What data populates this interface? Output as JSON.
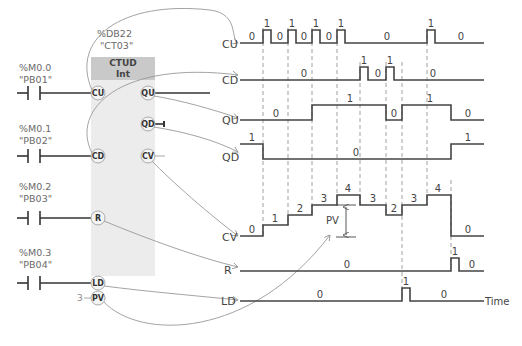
{
  "block": {
    "db_address": "%DB22",
    "db_name": "\"CT03\"",
    "type": "CTUD",
    "datatype": "Int",
    "inputs": [
      "CU",
      "CD",
      "R",
      "LD",
      "PV"
    ],
    "outputs": [
      "QU",
      "QD",
      "CV"
    ],
    "pv_value": "3"
  },
  "contacts": [
    {
      "address": "%M0.0",
      "tag": "\"PB01\"",
      "pin": "CU"
    },
    {
      "address": "%M0.1",
      "tag": "\"PB02\"",
      "pin": "CD"
    },
    {
      "address": "%M0.2",
      "tag": "\"PB03\"",
      "pin": "R"
    },
    {
      "address": "%M0.3",
      "tag": "\"PB04\"",
      "pin": "LD"
    }
  ],
  "timing": {
    "signals": [
      "CU",
      "CD",
      "QU",
      "QD",
      "CV",
      "R",
      "LD"
    ],
    "time_label": "Time",
    "pv_label": "PV",
    "cu_labels": [
      "0",
      "1",
      "0",
      "1",
      "0",
      "1",
      "0",
      "1",
      "0",
      "0",
      "1",
      "0"
    ],
    "cd_labels": [
      "0",
      "1",
      "0",
      "1",
      "0"
    ],
    "qu_labels": [
      "0",
      "1",
      "0",
      "1",
      "0"
    ],
    "qd_labels": [
      "1",
      "0",
      "1"
    ],
    "cv_labels": [
      "0",
      "1",
      "2",
      "3",
      "4",
      "3",
      "2",
      "3",
      "4",
      "0"
    ],
    "r_labels": [
      "0",
      "1",
      "0"
    ],
    "ld_labels": [
      "0",
      "1",
      "0"
    ]
  }
}
